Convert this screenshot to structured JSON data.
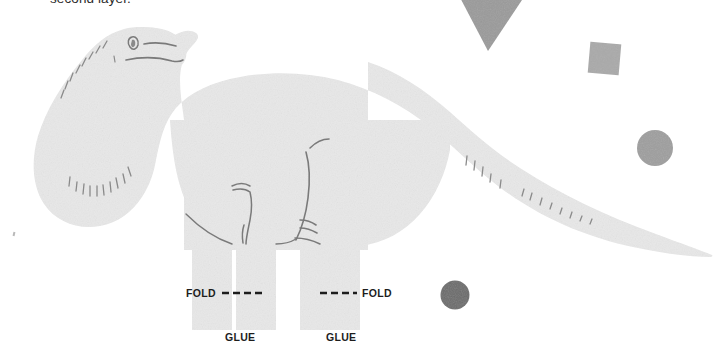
{
  "page": {
    "width": 720,
    "height": 351,
    "background_color": "#ffffff"
  },
  "caption": {
    "text": "second layer.",
    "note": "partially clipped at top edge of the image"
  },
  "labels": {
    "fold_left": "FOLD",
    "fold_right": "FOLD",
    "glue_left": "GLUE",
    "glue_right": "GLUE"
  },
  "figure": {
    "name": "sauropod-dinosaur-silhouette",
    "fill_color": "#e8e8e8",
    "line_color": "#6e6e6e",
    "details": [
      "neck hatch marks",
      "tail hatch marks",
      "eye",
      "mouth line",
      "front leg contour",
      "rear leg contour"
    ]
  },
  "guides": {
    "fold_line_color": "#1d1d1d",
    "fold_line_style": "dashed",
    "fold_line_left": {
      "x1": 222,
      "x2": 262,
      "y": 293
    },
    "fold_line_right": {
      "x1": 320,
      "x2": 357,
      "y": 293
    }
  },
  "shapes": [
    {
      "name": "triangle-marker",
      "type": "triangle",
      "direction": "down",
      "color": "#9a9a9a",
      "x": 455,
      "y": 0,
      "width": 75,
      "height": 50
    },
    {
      "name": "square-marker",
      "type": "square",
      "color": "#a9a9a9",
      "x": 589,
      "y": 43,
      "width": 31,
      "height": 31,
      "rotation_deg": 5
    },
    {
      "name": "circle-marker-light",
      "type": "circle",
      "color": "#9e9e9e",
      "cx": 655,
      "cy": 148,
      "diameter": 36
    },
    {
      "name": "circle-marker-dark",
      "type": "circle",
      "color": "#6b6b6b",
      "cx": 455,
      "cy": 295,
      "diameter": 29
    }
  ]
}
